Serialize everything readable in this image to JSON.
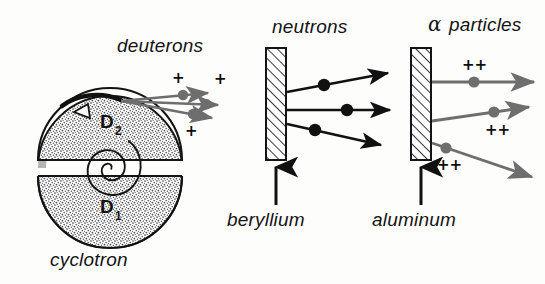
{
  "figure": {
    "background_color": "#fdfdfc",
    "ink_color": "#141414",
    "beam_gray": "#6e6e6e"
  },
  "labels": {
    "deuterons": "deuterons",
    "neutrons": "neutrons",
    "alpha_particles": "α particles",
    "alpha_symbol": "α",
    "alpha_word": "particles",
    "beryllium": "beryllium",
    "aluminum": "aluminum",
    "cyclotron": "cyclotron",
    "dee_upper": "D",
    "dee_upper_sub": "2",
    "dee_lower": "D",
    "dee_lower_sub": "1"
  },
  "charges": {
    "deuteron": "+",
    "alpha": "++"
  },
  "cyclotron": {
    "center_x": 110,
    "center_y": 168,
    "radius": 72,
    "gap_top": 160,
    "gap_bottom": 176,
    "fill": "#e9e9e7",
    "spiral_turns": 2.1,
    "spiral_max_radius": 30,
    "deflector_label": "extraction-deflector"
  },
  "targets": [
    {
      "name": "beryllium",
      "x": 266,
      "y": 48,
      "width": 20,
      "height": 112,
      "hatch": "diagonal-up-right",
      "label": "beryllium",
      "label_x": 268,
      "label_y": 220,
      "arrow_from_y": 205,
      "arrow_to_y": 166
    },
    {
      "name": "aluminum",
      "x": 411,
      "y": 48,
      "width": 20,
      "height": 112,
      "hatch": "diagonal-up-right",
      "label": "aluminum",
      "label_x": 412,
      "label_y": 220,
      "arrow_from_y": 205,
      "arrow_to_y": 166
    }
  ],
  "beams": {
    "deuterons": {
      "color": "#6e6e6e",
      "count": 3,
      "charge": "+",
      "origin_x": 121,
      "origin_y": 101,
      "lines": [
        {
          "x1": 121,
          "y1": 101,
          "x2": 212,
          "y2": 93,
          "dot_x": 183,
          "dot_y": 95,
          "charge_x": 176,
          "charge_y": 78
        },
        {
          "x1": 121,
          "y1": 101,
          "x2": 222,
          "y2": 105,
          "dot_x": 206,
          "dot_y": 104,
          "charge_x": 219,
          "charge_y": 88
        },
        {
          "x1": 121,
          "y1": 101,
          "x2": 216,
          "y2": 118,
          "dot_x": 193,
          "dot_y": 114,
          "charge_x": 189,
          "charge_y": 132
        }
      ]
    },
    "neutrons": {
      "color": "#111111",
      "count": 3,
      "charge": "",
      "lines": [
        {
          "x1": 287,
          "y1": 92,
          "x2": 392,
          "y2": 73,
          "dot_x": 324,
          "dot_y": 85
        },
        {
          "x1": 287,
          "y1": 110,
          "x2": 394,
          "y2": 110,
          "dot_x": 347,
          "dot_y": 110
        },
        {
          "x1": 287,
          "y1": 124,
          "x2": 385,
          "y2": 145,
          "dot_x": 315,
          "dot_y": 130
        }
      ]
    },
    "alphas": {
      "color": "#6e6e6e",
      "count": 3,
      "charge": "++",
      "lines": [
        {
          "x1": 432,
          "y1": 82,
          "x2": 538,
          "y2": 82,
          "dot_x": 474,
          "dot_y": 82,
          "charge_x": 464,
          "charge_y": 66
        },
        {
          "x1": 432,
          "y1": 121,
          "x2": 533,
          "y2": 107,
          "dot_x": 494,
          "dot_y": 112,
          "charge_x": 487,
          "charge_y": 131
        },
        {
          "x1": 432,
          "y1": 143,
          "x2": 536,
          "y2": 178,
          "dot_x": 446,
          "dot_y": 148,
          "charge_x": 440,
          "charge_y": 164
        }
      ]
    }
  }
}
